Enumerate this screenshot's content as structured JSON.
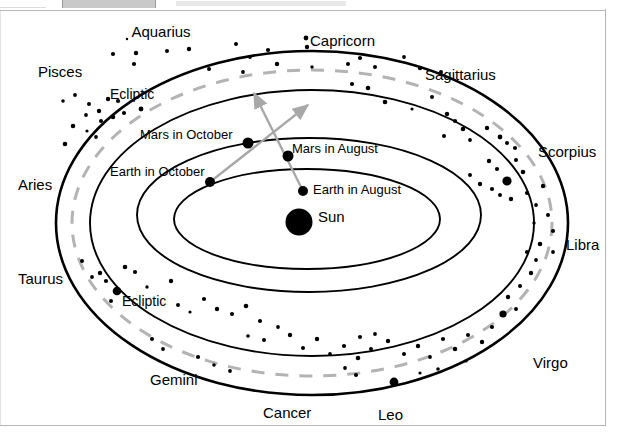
{
  "figure": {
    "colors": {
      "ink": "#000000",
      "ecliptic_dash": "#b3b3b3",
      "sightline": "#a8a8a8",
      "chrome_gray": "#c9c9c9",
      "border_gray": "#b5b5b5",
      "background": "#ffffff"
    }
  },
  "zodiac_labels": [
    {
      "name": "Aquarius",
      "x": 161,
      "y": 15,
      "align": "center"
    },
    {
      "name": "Capricorn",
      "x": 310,
      "y": 24,
      "align": "left"
    },
    {
      "name": "Sagittarius",
      "x": 425,
      "y": 58,
      "align": "left"
    },
    {
      "name": "Pisces",
      "x": 38,
      "y": 55,
      "align": "left"
    },
    {
      "name": "Scorpius",
      "x": 538,
      "y": 135,
      "align": "left"
    },
    {
      "name": "Aries",
      "x": 18,
      "y": 168,
      "align": "left"
    },
    {
      "name": "Libra",
      "x": 566,
      "y": 228,
      "align": "left"
    },
    {
      "name": "Taurus",
      "x": 18,
      "y": 262,
      "align": "left"
    },
    {
      "name": "Virgo",
      "x": 533,
      "y": 346,
      "align": "left"
    },
    {
      "name": "Gemini",
      "x": 150,
      "y": 363,
      "align": "left"
    },
    {
      "name": "Cancer",
      "x": 263,
      "y": 396,
      "align": "left"
    },
    {
      "name": "Leo",
      "x": 378,
      "y": 398,
      "align": "left"
    }
  ],
  "ecliptic_labels": [
    {
      "text": "Ecliptic",
      "x": 110,
      "y": 78
    },
    {
      "text": "Ecliptic",
      "x": 122,
      "y": 285
    }
  ],
  "body_labels": [
    {
      "text": "Mars in October",
      "x": 140,
      "y": 119
    },
    {
      "text": "Mars in August",
      "x": 292,
      "y": 133
    },
    {
      "text": "Earth in October",
      "x": 110,
      "y": 156
    },
    {
      "text": "Earth in August",
      "x": 313,
      "y": 174
    },
    {
      "text": "Sun",
      "x": 318,
      "y": 200
    }
  ],
  "bodies": [
    {
      "name": "Mars in October",
      "x": 248,
      "y": 134,
      "r": 5.5
    },
    {
      "name": "Mars in August",
      "x": 288,
      "y": 147,
      "r": 5.5
    },
    {
      "name": "Earth in October",
      "x": 210,
      "y": 173,
      "r": 5.0
    },
    {
      "name": "Earth in August",
      "x": 303,
      "y": 182,
      "r": 5.0
    },
    {
      "name": "Sun",
      "x": 299,
      "y": 213,
      "r": 13.5
    }
  ],
  "sightlines": [
    {
      "name": "august-sightline",
      "from": "Earth in August",
      "through": "Mars in August",
      "x1": 303,
      "y1": 182,
      "x2": 254,
      "y2": 84
    },
    {
      "name": "october-sightline",
      "from": "Earth in October",
      "through": "Mars in October",
      "x1": 210,
      "y1": 173,
      "x2": 308,
      "y2": 96
    }
  ],
  "orbits": [
    {
      "name": "celestial-sphere-outer",
      "cx": 312,
      "cy": 214,
      "rx": 256,
      "ry": 172
    },
    {
      "name": "celestial-sphere-inner",
      "cx": 312,
      "cy": 214,
      "rx": 222,
      "ry": 133
    },
    {
      "name": "mars-orbit",
      "cx": 309,
      "cy": 206,
      "rx": 172,
      "ry": 77
    },
    {
      "name": "earth-orbit",
      "cx": 307,
      "cy": 210,
      "rx": 133,
      "ry": 50
    }
  ],
  "ecliptic_rings": [
    {
      "name": "ecliptic-dashed",
      "cx": 312,
      "cy": 214,
      "rx": 240,
      "ry": 153
    }
  ],
  "stars_upper": [
    [
      127,
      30,
      1.2
    ],
    [
      113,
      45,
      2.1
    ],
    [
      136,
      44,
      2.2
    ],
    [
      167,
      42,
      2.0
    ],
    [
      189,
      40,
      2.2
    ],
    [
      134,
      55,
      2.1
    ],
    [
      236,
      35,
      2.0
    ],
    [
      250,
      48,
      1.9
    ],
    [
      268,
      41,
      2.1
    ],
    [
      209,
      60,
      2.0
    ],
    [
      306,
      29,
      2.4
    ],
    [
      307,
      38,
      2.2
    ],
    [
      243,
      63,
      1.9
    ],
    [
      277,
      55,
      2.2
    ],
    [
      312,
      58,
      1.7
    ],
    [
      348,
      55,
      2.0
    ],
    [
      360,
      49,
      2.1
    ],
    [
      375,
      58,
      2.0
    ],
    [
      404,
      48,
      1.9
    ],
    [
      420,
      59,
      2.2
    ],
    [
      441,
      63,
      2.0
    ],
    [
      352,
      75,
      2.1
    ],
    [
      368,
      79,
      2.3
    ],
    [
      63,
      92,
      1.8
    ],
    [
      75,
      86,
      1.9
    ],
    [
      89,
      95,
      2.0
    ],
    [
      99,
      102,
      2.2
    ],
    [
      108,
      90,
      2.2
    ],
    [
      118,
      92,
      2.1
    ],
    [
      86,
      106,
      1.9
    ],
    [
      101,
      112,
      2.0
    ],
    [
      113,
      108,
      2.3
    ],
    [
      124,
      104,
      2.1
    ],
    [
      141,
      100,
      2.4
    ],
    [
      73,
      117,
      2.3
    ],
    [
      87,
      122,
      1.6
    ],
    [
      96,
      128,
      1.9
    ],
    [
      65,
      135,
      2.3
    ],
    [
      385,
      93,
      2.3
    ],
    [
      412,
      100,
      1.6
    ],
    [
      432,
      88,
      2.0
    ],
    [
      447,
      105,
      2.2
    ],
    [
      455,
      112,
      2.1
    ],
    [
      463,
      120,
      2.3
    ],
    [
      444,
      127,
      2.0
    ],
    [
      470,
      131,
      1.9
    ],
    [
      487,
      119,
      2.2
    ],
    [
      500,
      128,
      2.4
    ],
    [
      507,
      134,
      2.0
    ],
    [
      515,
      139,
      2.1
    ],
    [
      507,
      172,
      4.6
    ],
    [
      489,
      152,
      2.2
    ],
    [
      497,
      160,
      2.1
    ],
    [
      516,
      151,
      2.0
    ],
    [
      523,
      163,
      2.3
    ],
    [
      470,
      166,
      2.0
    ],
    [
      480,
      175,
      2.2
    ],
    [
      492,
      180,
      2.1
    ],
    [
      500,
      186,
      2.0
    ],
    [
      511,
      190,
      2.2
    ],
    [
      527,
      184,
      2.1
    ],
    [
      536,
      196,
      1.9
    ],
    [
      543,
      177,
      2.2
    ],
    [
      548,
      206,
      2.0
    ],
    [
      534,
      214,
      1.7
    ],
    [
      553,
      222,
      2.1
    ],
    [
      540,
      235,
      2.3
    ],
    [
      553,
      243,
      1.9
    ]
  ],
  "stars_lower": [
    [
      82,
      252,
      2.0
    ],
    [
      100,
      264,
      2.2
    ],
    [
      117,
      282,
      4.3
    ],
    [
      106,
      272,
      2.1
    ],
    [
      92,
      268,
      1.9
    ],
    [
      125,
      258,
      2.3
    ],
    [
      135,
      263,
      2.1
    ],
    [
      111,
      292,
      2.0
    ],
    [
      147,
      278,
      1.7
    ],
    [
      171,
      272,
      2.2
    ],
    [
      178,
      296,
      2.0
    ],
    [
      190,
      303,
      1.6
    ],
    [
      204,
      290,
      2.1
    ],
    [
      217,
      300,
      2.2
    ],
    [
      232,
      305,
      2.0
    ],
    [
      246,
      297,
      2.3
    ],
    [
      260,
      312,
      2.1
    ],
    [
      248,
      327,
      1.8
    ],
    [
      264,
      331,
      2.0
    ],
    [
      278,
      318,
      1.9
    ],
    [
      290,
      326,
      2.2
    ],
    [
      303,
      339,
      2.0
    ],
    [
      317,
      330,
      2.2
    ],
    [
      330,
      345,
      1.9
    ],
    [
      344,
      337,
      2.1
    ],
    [
      358,
      349,
      2.3
    ],
    [
      371,
      340,
      2.0
    ],
    [
      360,
      328,
      2.1
    ],
    [
      375,
      325,
      1.9
    ],
    [
      388,
      332,
      2.2
    ],
    [
      394,
      373,
      4.4
    ],
    [
      404,
      345,
      2.0
    ],
    [
      418,
      337,
      2.2
    ],
    [
      430,
      348,
      1.9
    ],
    [
      443,
      330,
      2.1
    ],
    [
      455,
      340,
      2.3
    ],
    [
      466,
      352,
      1.6
    ],
    [
      468,
      326,
      2.0
    ],
    [
      482,
      333,
      2.2
    ],
    [
      492,
      318,
      2.1
    ],
    [
      503,
      305,
      3.6
    ],
    [
      516,
      300,
      2.0
    ],
    [
      508,
      288,
      2.2
    ],
    [
      520,
      277,
      2.0
    ],
    [
      531,
      264,
      2.2
    ],
    [
      536,
      251,
      1.9
    ],
    [
      527,
      243,
      2.1
    ],
    [
      345,
      359,
      1.9
    ],
    [
      356,
      366,
      2.1
    ],
    [
      420,
      364,
      1.6
    ],
    [
      438,
      360,
      1.8
    ],
    [
      163,
      340,
      1.9
    ],
    [
      152,
      330,
      2.0
    ],
    [
      198,
      348,
      2.1
    ],
    [
      214,
      356,
      1.8
    ],
    [
      230,
      362,
      1.9
    ]
  ]
}
